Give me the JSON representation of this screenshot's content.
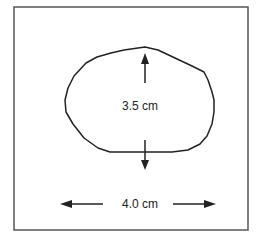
{
  "diagram": {
    "shape": "irregular-lesion-outline",
    "height_label": "3.5 cm",
    "width_label": "4.0 cm",
    "colors": {
      "stroke": "#222222",
      "frame": "#555555",
      "background": "#ffffff"
    }
  }
}
